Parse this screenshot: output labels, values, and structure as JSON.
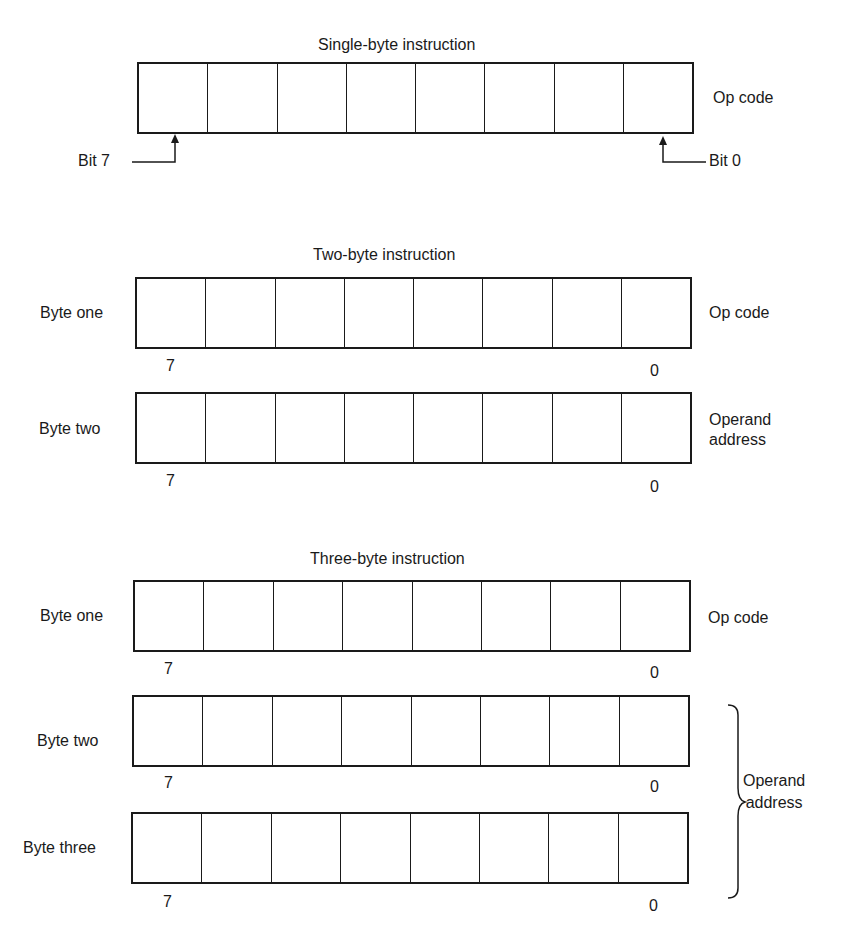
{
  "diagram": {
    "single": {
      "title": "Single-byte instruction",
      "right_label": "Op code",
      "bit7_label": "Bit 7",
      "bit0_label": "Bit 0"
    },
    "two": {
      "title": "Two-byte instruction",
      "bytes": [
        {
          "label": "Byte one",
          "right_label": "Op code",
          "high": "7",
          "low": "0"
        },
        {
          "label": "Byte two",
          "right_label_line1": "Operand",
          "right_label_line2": "address",
          "high": "7",
          "low": "0"
        }
      ]
    },
    "three": {
      "title": "Three-byte instruction",
      "bytes": [
        {
          "label": "Byte one",
          "right_label": "Op code",
          "high": "7",
          "low": "0"
        },
        {
          "label": "Byte two",
          "high": "7",
          "low": "0"
        },
        {
          "label": "Byte three",
          "high": "7",
          "low": "0"
        }
      ],
      "brace_label_line1": "Operand",
      "brace_label_line2": "address"
    },
    "bits_per_byte": 8
  }
}
